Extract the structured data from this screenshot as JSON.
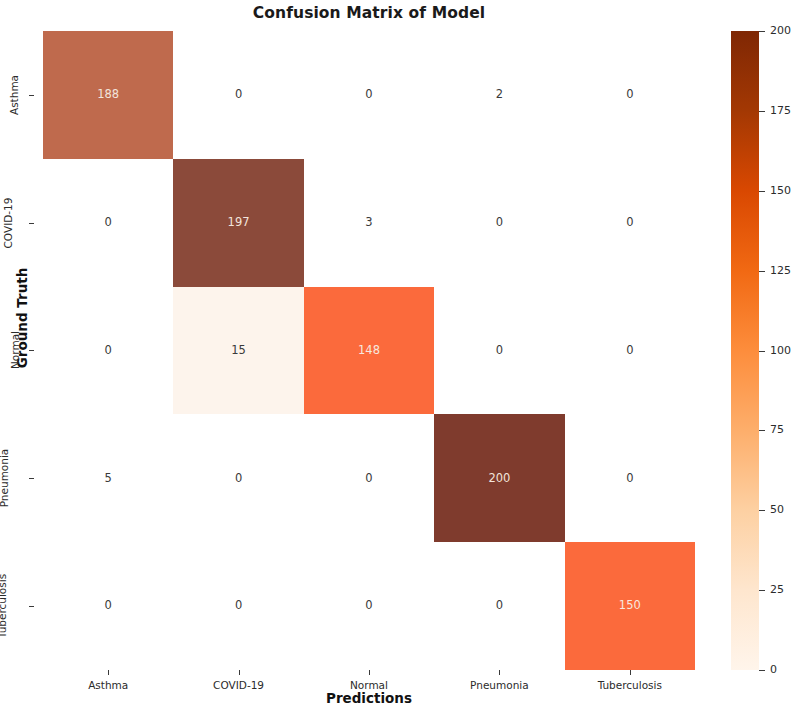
{
  "chart_data": {
    "type": "heatmap",
    "title": "Confusion Matrix of Model",
    "xlabel": "Predictions",
    "ylabel": "Ground Truth",
    "x_categories": [
      "Asthma",
      "COVID-19",
      "Normal",
      "Pneumonia",
      "Tuberculosis"
    ],
    "y_categories": [
      "Asthma",
      "COVID-19",
      "Normal",
      "Pneumonia",
      "Tuberculosis"
    ],
    "values": [
      [
        188,
        0,
        0,
        2,
        0
      ],
      [
        0,
        197,
        3,
        0,
        0
      ],
      [
        0,
        15,
        148,
        0,
        0
      ],
      [
        5,
        0,
        0,
        200,
        0
      ],
      [
        0,
        0,
        0,
        0,
        150
      ]
    ],
    "annotate": true,
    "grid": false,
    "colormap": "Oranges",
    "vmin": 0,
    "vmax": 200,
    "colorbar": {
      "position": "right",
      "ticks": [
        0,
        25,
        50,
        75,
        100,
        125,
        150,
        175,
        200
      ],
      "tick_labels": [
        "0",
        "25",
        "50",
        "75",
        "100",
        "125",
        "150",
        "175",
        "200"
      ]
    },
    "cell_colors": [
      [
        "#bf6a4d",
        "#ffffff",
        "#ffffff",
        "#ffffff",
        "#ffffff"
      ],
      [
        "#ffffff",
        "#8b4a3a",
        "#ffffff",
        "#ffffff",
        "#ffffff"
      ],
      [
        "#ffffff",
        "#fdf4ec",
        "#fb6a3c",
        "#ffffff",
        "#ffffff"
      ],
      [
        "#ffffff",
        "#ffffff",
        "#ffffff",
        "#7f3b2d",
        "#ffffff"
      ],
      [
        "#ffffff",
        "#ffffff",
        "#ffffff",
        "#ffffff",
        "#fb6a3c"
      ]
    ],
    "cell_text_colors": [
      [
        "#f2e4dc",
        "#3a3a3a",
        "#3a3a3a",
        "#3a3a3a",
        "#3a3a3a"
      ],
      [
        "#3a3a3a",
        "#f2e4dc",
        "#3a3a3a",
        "#3a3a3a",
        "#3a3a3a"
      ],
      [
        "#3a3a3a",
        "#3a3a3a",
        "#f7e7df",
        "#3a3a3a",
        "#3a3a3a"
      ],
      [
        "#3a3a3a",
        "#3a3a3a",
        "#3a3a3a",
        "#f2e4dc",
        "#3a3a3a"
      ],
      [
        "#3a3a3a",
        "#3a3a3a",
        "#3a3a3a",
        "#3a3a3a",
        "#f7e7df"
      ]
    ]
  }
}
